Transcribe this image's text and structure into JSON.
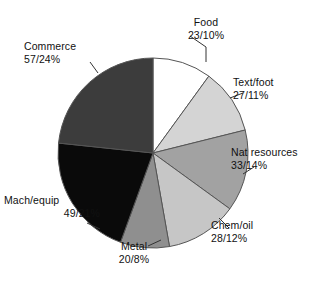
{
  "chart_data": {
    "type": "pie",
    "title": "",
    "subtitle": "",
    "xlabel": "",
    "ylabel": "",
    "legend_position": "none",
    "grid": false,
    "label_format": "value/percent",
    "total_value": 237,
    "categories": [
      "Food",
      "Text/foot",
      "Nat resources",
      "Chem/oil",
      "Metal",
      "Mach/equip",
      "Commerce"
    ],
    "values": [
      23,
      27,
      33,
      28,
      20,
      49,
      57
    ],
    "percents": [
      10,
      11,
      14,
      12,
      8,
      21,
      24
    ],
    "start_angle_deg": 0,
    "direction": "clockwise",
    "slices": [
      {
        "label": "Food",
        "value": 23,
        "percent": 10,
        "value_text": "23/10%",
        "color": "#ffffff",
        "start_deg": 0,
        "sweep_deg": 36,
        "label_line1": "Food",
        "label_line2": "23/10%"
      },
      {
        "label": "Text/foot",
        "value": 27,
        "percent": 11,
        "value_text": "27/11%",
        "color": "#d4d4d4",
        "start_deg": 36,
        "sweep_deg": 40,
        "label_line1": "Text/foot",
        "label_line2": "27/11%"
      },
      {
        "label": "Nat resources",
        "value": 33,
        "percent": 14,
        "value_text": "33/14%",
        "color": "#a2a2a2",
        "start_deg": 76,
        "sweep_deg": 50,
        "label_line1": "Nat resources",
        "label_line2": "33/14%"
      },
      {
        "label": "Chem/oil",
        "value": 28,
        "percent": 12,
        "value_text": "28/12%",
        "color": "#c6c6c6",
        "start_deg": 126,
        "sweep_deg": 44,
        "label_line1": "Chem/oil",
        "label_line2": "28/12%"
      },
      {
        "label": "Metal",
        "value": 20,
        "percent": 8,
        "value_text": "20/8%",
        "color": "#8f8f8f",
        "start_deg": 170,
        "sweep_deg": 30,
        "label_line1": "Metal",
        "label_line2": "20/8%"
      },
      {
        "label": "Mach/equip",
        "value": 49,
        "percent": 21,
        "value_text": "49/21%",
        "color": "#0a0a0a",
        "start_deg": 200,
        "sweep_deg": 76,
        "label_line1": "Mach/equip",
        "label_line2": "49/21%"
      },
      {
        "label": "Commerce",
        "value": 57,
        "percent": 24,
        "value_text": "57/24%",
        "color": "#3c3c3c",
        "start_deg": 276,
        "sweep_deg": 84,
        "label_line1": "Commerce",
        "label_line2": "57/24%"
      }
    ],
    "geometry": {
      "cx": 153,
      "cy": 153,
      "r": 95
    },
    "stroke_color": "#555555",
    "background": "#ffffff"
  }
}
